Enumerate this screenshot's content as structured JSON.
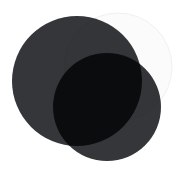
{
  "figure": {
    "width": 183,
    "height": 172,
    "background_color": "#ffffff"
  },
  "chart_data": {
    "type": "venn",
    "title": "",
    "subtitle": "",
    "xlabel": "",
    "ylabel": "",
    "legend_position": "none",
    "grid": false,
    "set_count": 3,
    "blend_mode": "multiply",
    "background_color": "#ffffff",
    "sets": [
      {
        "name": "left-circle",
        "label": "",
        "cx": 77,
        "cy": 81,
        "r": 65,
        "fill": "#343639",
        "opacity": 1,
        "stroke": "none",
        "stroke_width": 0
      },
      {
        "name": "top-right-circle",
        "label": "",
        "cx": 118,
        "cy": 67,
        "r": 54,
        "fill": "#fbfbfb",
        "opacity": 1,
        "stroke": "#f0f0f0",
        "stroke_width": 1
      },
      {
        "name": "bottom-circle",
        "label": "",
        "cx": 107,
        "cy": 107,
        "r": 54,
        "fill": "#343639",
        "opacity": 1,
        "stroke": "none",
        "stroke_width": 0
      }
    ],
    "regions": [
      {
        "name": "left-only",
        "sets": [
          "left-circle"
        ],
        "color": "#343639"
      },
      {
        "name": "top-right-only",
        "sets": [
          "top-right-circle"
        ],
        "color": "#fbfbfb"
      },
      {
        "name": "bottom-only",
        "sets": [
          "bottom-circle"
        ],
        "color": "#343639"
      },
      {
        "name": "left-and-top-right",
        "sets": [
          "left-circle",
          "top-right-circle"
        ],
        "color": "#6e7073"
      },
      {
        "name": "top-right-and-bottom",
        "sets": [
          "top-right-circle",
          "bottom-circle"
        ],
        "color": "#6e7073"
      },
      {
        "name": "left-and-bottom",
        "sets": [
          "left-circle",
          "bottom-circle"
        ],
        "color": "#1a1c1e"
      },
      {
        "name": "all-three",
        "sets": [
          "left-circle",
          "top-right-circle",
          "bottom-circle"
        ],
        "color": "#000000"
      }
    ]
  }
}
